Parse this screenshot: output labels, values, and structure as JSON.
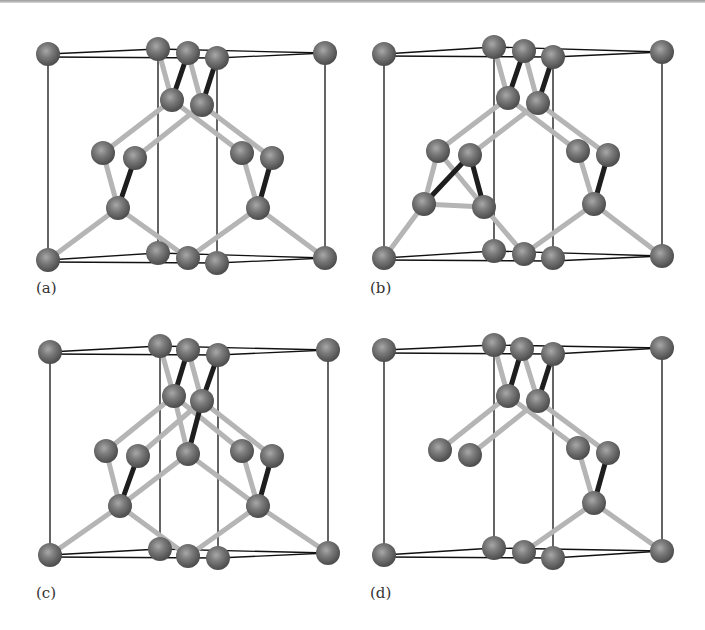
{
  "figure": {
    "colors": {
      "atom": "#6f6f6f",
      "atom_highlight": "#a8a8a8",
      "bond_light": "#b5b5b5",
      "bond_dark": "#1e1e1e",
      "cell_edge": "#111111",
      "background": "#ffffff"
    },
    "panels": [
      {
        "id": "a",
        "label": "(a)"
      },
      {
        "id": "b",
        "label": "(b)"
      },
      {
        "id": "c",
        "label": "(c)"
      },
      {
        "id": "d",
        "label": "(d)"
      }
    ]
  }
}
